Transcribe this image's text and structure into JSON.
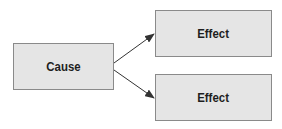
{
  "diagram": {
    "cause": {
      "label": "Cause"
    },
    "effects": [
      {
        "label": "Effect"
      },
      {
        "label": "Effect"
      }
    ],
    "colors": {
      "box_fill": "#e5e5e5",
      "box_border": "#8a8a8a",
      "arrow": "#333333",
      "text": "#1e1e1e"
    }
  }
}
